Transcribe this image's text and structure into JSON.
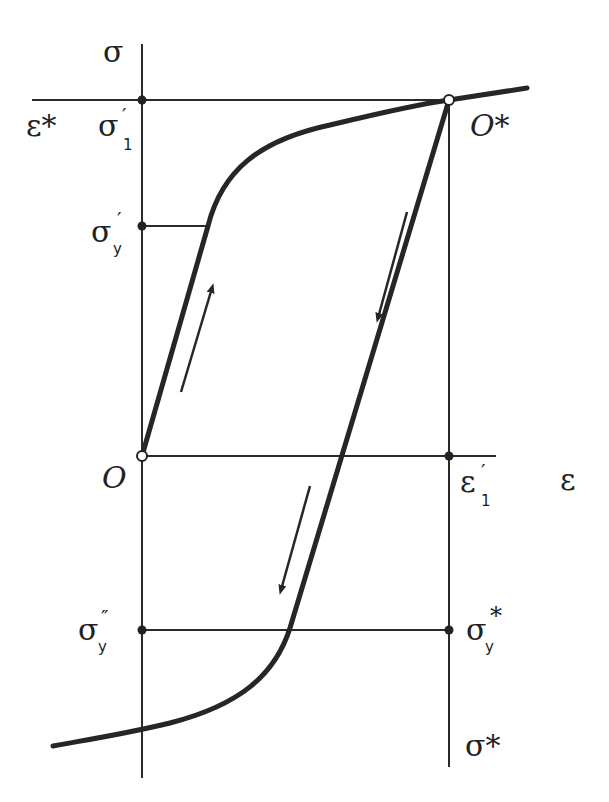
{
  "diagram": {
    "type": "stress-strain hysteresis (Bauschinger effect) diagram",
    "axes": {
      "vertical": {
        "label": "σ"
      },
      "horizontal": {
        "label": "ε"
      }
    },
    "labels": {
      "sigma_axis": "σ",
      "epsilon_axis": "ε",
      "epsilon_star": "ε*",
      "sigma1_prime": {
        "base": "σ",
        "sub": "1",
        "mark": "′"
      },
      "sigmay_prime": {
        "base": "σ",
        "sub": "y",
        "mark": "′"
      },
      "origin": "O",
      "origin_star": "O*",
      "epsilon1_prime": {
        "base": "ε",
        "sub": "1",
        "mark": "′"
      },
      "sigmay_double_prime": {
        "base": "σ",
        "sub": "y",
        "mark": "″"
      },
      "sigmay_star": {
        "base": "σ",
        "sub": "y",
        "mark": "*"
      },
      "sigma_star": "σ*"
    },
    "points": {
      "O": [
        142,
        456
      ],
      "O_star": [
        449,
        100
      ],
      "sigma_y_prime": [
        142,
        226
      ],
      "sigma1_prime": [
        142,
        100
      ],
      "epsilon1_prime": [
        449,
        456
      ],
      "sigma_y_double_prime": [
        142,
        630
      ],
      "sigma_y_star": [
        449,
        630
      ]
    },
    "arrows": [
      {
        "name": "loading-arrow",
        "direction": "up"
      },
      {
        "name": "unloading-arrow",
        "direction": "down"
      },
      {
        "name": "reverse-loading-arrow",
        "direction": "down"
      }
    ]
  }
}
